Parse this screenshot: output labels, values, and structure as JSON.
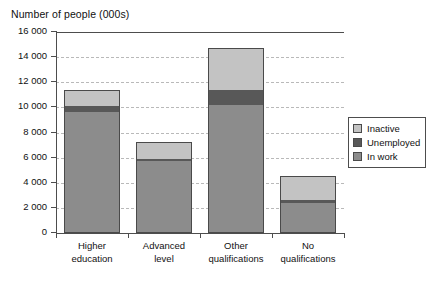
{
  "chart_data": {
    "type": "bar",
    "variant": "stacked",
    "title": "Number of people (000s)",
    "xlabel": "",
    "ylabel": "Number of people (000s)",
    "ylim": [
      0,
      16000
    ],
    "ytick_step": 2000,
    "yticks": [
      "0",
      "2 000",
      "4 000",
      "6 000",
      "8 000",
      "10 000",
      "12 000",
      "14 000",
      "16 000"
    ],
    "ytick_values": [
      0,
      2000,
      4000,
      6000,
      8000,
      10000,
      12000,
      14000,
      16000
    ],
    "grid": true,
    "grid_axis": "y",
    "legend_position": "right",
    "categories": [
      "Higher education",
      "Advanced level",
      "Other qualifications",
      "No qualifications"
    ],
    "category_lines": [
      [
        "Higher",
        "education"
      ],
      [
        "Advanced",
        "level"
      ],
      [
        "Other",
        "qualifications"
      ],
      [
        "No",
        "qualifications"
      ]
    ],
    "series": [
      {
        "name": "In work",
        "color": "#8c8c8c",
        "values": [
          9650,
          5700,
          10200,
          2350
        ]
      },
      {
        "name": "Unemployed",
        "color": "#585858",
        "values": [
          500,
          200,
          1150,
          300
        ]
      },
      {
        "name": "Inactive",
        "color": "#c3c3c3",
        "values": [
          1250,
          1350,
          3350,
          1850
        ]
      }
    ],
    "totals": [
      11400,
      7250,
      14700,
      4500
    ],
    "stack_order": [
      "In work",
      "Unemployed",
      "Inactive"
    ]
  },
  "legend": {
    "items": [
      {
        "label": "Inactive",
        "color": "#c3c3c3"
      },
      {
        "label": "Unemployed",
        "color": "#585858"
      },
      {
        "label": "In work",
        "color": "#8c8c8c"
      }
    ]
  },
  "colors": {
    "axis": "#4d4d4d",
    "grid": "#b9b9b9",
    "text": "#111111",
    "background": "#ffffff"
  },
  "footnote": {
    "text": ""
  }
}
